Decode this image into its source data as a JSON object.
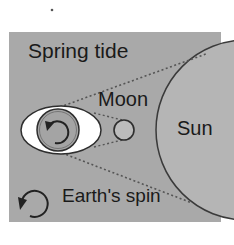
{
  "title": "Spring tide",
  "labels": {
    "moon": "Moon",
    "sun": "Sun",
    "earth_spin": "Earth's spin"
  },
  "colors": {
    "background": "#ffffff",
    "panel": "#a9a9a9",
    "sun_fill": "#b5b5b5",
    "sun_stroke": "#3a3a3a",
    "bulge_fill": "#ffffff",
    "earth_fill": "#a4a4a4",
    "moon_fill": "#bcbcbc",
    "outline": "#2e2e2e",
    "dotted": "#555555",
    "text": "#1a1a1a"
  },
  "icons": {
    "earth_rotation": "counterclockwise-arrow-icon",
    "spin_legend": "counterclockwise-arrow-icon"
  }
}
